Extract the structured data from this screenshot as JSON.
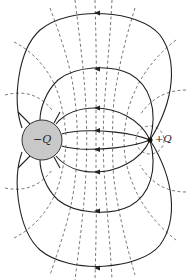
{
  "diagram": {
    "charges": [
      {
        "id": "negative",
        "label": "−Q",
        "cx": 42,
        "cy": 140,
        "r": 20,
        "fill": "#c8c8c8"
      },
      {
        "id": "positive",
        "label": "+Q",
        "cx": 150,
        "cy": 140,
        "r": 2.5,
        "fill": "#111111"
      }
    ],
    "colors": {
      "field_line": "#222222",
      "equipotential": "#555555",
      "charge_fill": "#c8c8c8",
      "background": "#ffffff"
    },
    "field_line_direction": "from +Q toward −Q (arrows point left)",
    "legend": {
      "solid": "field lines",
      "dashed": "equipotentials"
    }
  }
}
